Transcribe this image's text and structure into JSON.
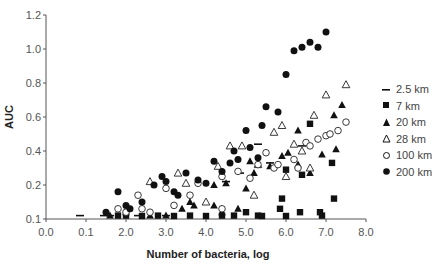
{
  "chart_data": {
    "type": "scatter",
    "title": "",
    "xlabel": "Number of bacteria, log",
    "ylabel": "AUC",
    "xlim": [
      0,
      8
    ],
    "ylim": [
      0.1,
      1.2
    ],
    "x_tick_labels": [
      "0.0",
      "0.1",
      "2.0",
      "3.0",
      "4.0",
      "5.0",
      "6.0",
      "7.0",
      "8.0"
    ],
    "y_tick_labels": [
      "0.1",
      "0.2",
      "0.4",
      "0.6",
      "0.8",
      "1.0",
      "1.2"
    ],
    "grid": false,
    "legend_position": "right",
    "series": [
      {
        "name": "2.5 km",
        "marker": "dash",
        "points": [
          [
            0.85,
            0.11
          ],
          [
            1.45,
            0.11
          ],
          [
            1.6,
            0.11
          ],
          [
            2.3,
            0.11
          ],
          [
            3.0,
            0.11
          ],
          [
            4.5,
            0.22
          ],
          [
            4.85,
            0.27
          ],
          [
            5.3,
            0.44
          ],
          [
            5.6,
            0.33
          ],
          [
            6.4,
            0.43
          ]
        ]
      },
      {
        "name": "7 km",
        "marker": "square",
        "points": [
          [
            1.8,
            0.11
          ],
          [
            2.0,
            0.11
          ],
          [
            2.4,
            0.1
          ],
          [
            2.8,
            0.11
          ],
          [
            3.2,
            0.1
          ],
          [
            3.6,
            0.11
          ],
          [
            4.0,
            0.1
          ],
          [
            4.4,
            0.11
          ],
          [
            4.7,
            0.11
          ],
          [
            5.0,
            0.12
          ],
          [
            5.3,
            0.11
          ],
          [
            5.4,
            0.1
          ],
          [
            5.85,
            0.13
          ],
          [
            5.9,
            0.16
          ],
          [
            6.0,
            0.1
          ],
          [
            6.35,
            0.12
          ],
          [
            6.85,
            0.12
          ],
          [
            6.9,
            0.11
          ],
          [
            7.15,
            0.33
          ],
          [
            7.2,
            0.16
          ],
          [
            6.0,
            0.29
          ],
          [
            6.4,
            0.26
          ],
          [
            6.6,
            0.56
          ]
        ]
      },
      {
        "name": "20 km",
        "marker": "filled-triangle",
        "points": [
          [
            1.6,
            0.11
          ],
          [
            2.0,
            0.12
          ],
          [
            2.6,
            0.11
          ],
          [
            3.0,
            0.11
          ],
          [
            3.4,
            0.13
          ],
          [
            3.6,
            0.15
          ],
          [
            4.2,
            0.14
          ],
          [
            4.4,
            0.12
          ],
          [
            4.8,
            0.13
          ],
          [
            5.0,
            0.19
          ],
          [
            5.2,
            0.27
          ],
          [
            5.6,
            0.31
          ],
          [
            5.9,
            0.37
          ],
          [
            6.05,
            0.39
          ],
          [
            6.3,
            0.32
          ],
          [
            6.6,
            0.27
          ],
          [
            6.9,
            0.38
          ],
          [
            7.2,
            0.61
          ],
          [
            7.25,
            0.41
          ],
          [
            7.4,
            0.67
          ],
          [
            6.3,
            0.52
          ],
          [
            5.1,
            0.34
          ],
          [
            4.5,
            0.21
          ],
          [
            4.2,
            0.2
          ],
          [
            3.7,
            0.14
          ]
        ]
      },
      {
        "name": "28 km",
        "marker": "open-triangle",
        "points": [
          [
            2.6,
            0.22
          ],
          [
            3.3,
            0.27
          ],
          [
            3.5,
            0.21
          ],
          [
            4.3,
            0.31
          ],
          [
            4.6,
            0.43
          ],
          [
            4.9,
            0.43
          ],
          [
            5.3,
            0.32
          ],
          [
            5.7,
            0.51
          ],
          [
            5.9,
            0.55
          ],
          [
            6.2,
            0.44
          ],
          [
            6.4,
            0.4
          ],
          [
            6.6,
            0.3
          ],
          [
            6.7,
            0.61
          ],
          [
            7.0,
            0.73
          ],
          [
            7.5,
            0.79
          ],
          [
            6.0,
            0.25
          ],
          [
            5.2,
            0.17
          ],
          [
            4.0,
            0.15
          ]
        ]
      },
      {
        "name": "100 km",
        "marker": "open-circle",
        "points": [
          [
            1.8,
            0.13
          ],
          [
            2.3,
            0.17
          ],
          [
            2.4,
            0.13
          ],
          [
            2.6,
            0.12
          ],
          [
            3.0,
            0.19
          ],
          [
            3.2,
            0.14
          ],
          [
            3.6,
            0.17
          ],
          [
            3.8,
            0.21
          ],
          [
            4.4,
            0.25
          ],
          [
            4.8,
            0.28
          ],
          [
            5.1,
            0.24
          ],
          [
            5.3,
            0.32
          ],
          [
            5.5,
            0.39
          ],
          [
            5.7,
            0.3
          ],
          [
            5.8,
            0.32
          ],
          [
            6.2,
            0.35
          ],
          [
            6.3,
            0.3
          ],
          [
            6.5,
            0.45
          ],
          [
            6.6,
            0.43
          ],
          [
            6.8,
            0.47
          ],
          [
            7.0,
            0.49
          ],
          [
            7.1,
            0.5
          ],
          [
            7.3,
            0.52
          ],
          [
            7.5,
            0.57
          ],
          [
            4.4,
            0.13
          ],
          [
            2.0,
            0.12
          ]
        ]
      },
      {
        "name": "200 km",
        "marker": "filled-circle",
        "points": [
          [
            1.5,
            0.12
          ],
          [
            1.8,
            0.18
          ],
          [
            2.0,
            0.14
          ],
          [
            2.1,
            0.13
          ],
          [
            2.4,
            0.15
          ],
          [
            2.7,
            0.2
          ],
          [
            3.0,
            0.22
          ],
          [
            3.2,
            0.18
          ],
          [
            3.3,
            0.17
          ],
          [
            3.5,
            0.27
          ],
          [
            3.8,
            0.23
          ],
          [
            4.0,
            0.21
          ],
          [
            4.2,
            0.34
          ],
          [
            4.4,
            0.28
          ],
          [
            4.6,
            0.33
          ],
          [
            4.8,
            0.35
          ],
          [
            5.0,
            0.52
          ],
          [
            5.1,
            0.42
          ],
          [
            5.3,
            0.36
          ],
          [
            5.5,
            0.66
          ],
          [
            5.8,
            0.63
          ],
          [
            6.0,
            0.85
          ],
          [
            6.2,
            0.99
          ],
          [
            6.4,
            1.01
          ],
          [
            6.6,
            1.04
          ],
          [
            6.8,
            1.01
          ],
          [
            7.0,
            1.1
          ],
          [
            5.4,
            0.55
          ],
          [
            4.7,
            0.4
          ],
          [
            2.9,
            0.25
          ]
        ]
      }
    ]
  },
  "legend": {
    "items": [
      {
        "label": "2.5 km"
      },
      {
        "label": "7 km"
      },
      {
        "label": "20 km"
      },
      {
        "label": "28 km"
      },
      {
        "label": "100 km"
      },
      {
        "label": "200 km"
      }
    ]
  }
}
